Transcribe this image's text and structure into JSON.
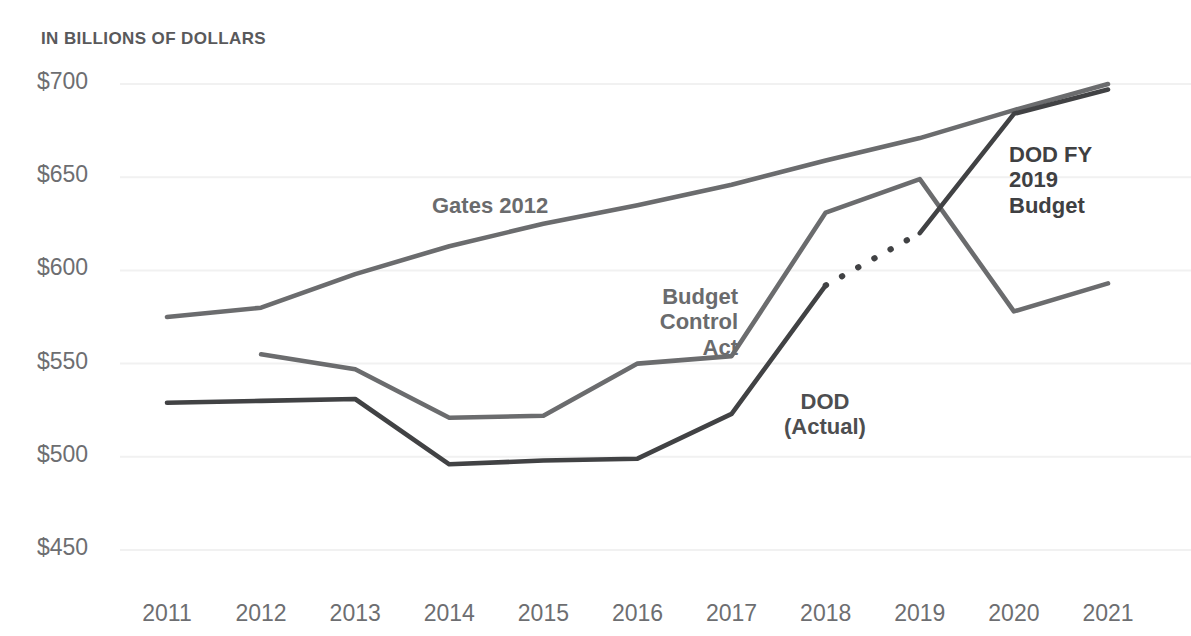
{
  "chart_data": {
    "type": "line",
    "title": "IN BILLIONS OF DOLLARS",
    "xlabel": "",
    "ylabel": "",
    "ylim": [
      450,
      700
    ],
    "xlim": [
      2011,
      2021
    ],
    "grid": true,
    "legend_position": "inline-annotations",
    "categories": [
      2011,
      2012,
      2013,
      2014,
      2015,
      2016,
      2017,
      2018,
      2019,
      2020,
      2021
    ],
    "y_ticks": [
      "$700",
      "$650",
      "$600",
      "$550",
      "$500",
      "$450"
    ],
    "y_tick_values": [
      700,
      650,
      600,
      550,
      500,
      450
    ],
    "x_ticks": [
      "2011",
      "2012",
      "2013",
      "2014",
      "2015",
      "2016",
      "2017",
      "2018",
      "2019",
      "2020",
      "2021"
    ],
    "series": [
      {
        "name": "Gates 2012",
        "color": "#6b6c6e",
        "style": "solid",
        "x": [
          2011,
          2012,
          2013,
          2014,
          2015,
          2016,
          2017,
          2018,
          2019,
          2020,
          2021
        ],
        "values": [
          575,
          580,
          598,
          613,
          625,
          635,
          646,
          659,
          671,
          686,
          700
        ]
      },
      {
        "name": "Budget Control Act",
        "color": "#6b6c6e",
        "style": "solid",
        "x": [
          2012,
          2013,
          2014,
          2015,
          2016,
          2017,
          2018,
          2019,
          2020,
          2021
        ],
        "values": [
          555,
          547,
          521,
          522,
          550,
          554,
          631,
          649,
          578,
          593
        ]
      },
      {
        "name": "DOD (Actual)",
        "color": "#414244",
        "style": "solid",
        "x": [
          2011,
          2012,
          2013,
          2014,
          2015,
          2016,
          2017,
          2018
        ],
        "values": [
          529,
          530,
          531,
          496,
          498,
          499,
          523,
          592
        ]
      },
      {
        "name": "DOD (Actual) projected",
        "color": "#414244",
        "style": "dotted",
        "x": [
          2018,
          2019
        ],
        "values": [
          592,
          620
        ]
      },
      {
        "name": "DOD FY 2019 Budget",
        "color": "#414244",
        "style": "solid",
        "x": [
          2019,
          2020,
          2021
        ],
        "values": [
          620,
          684,
          697
        ]
      }
    ],
    "annotations": [
      {
        "id": "gates",
        "text": "Gates 2012"
      },
      {
        "id": "bca",
        "text": "Budget\nControl\nAct"
      },
      {
        "id": "dod_actual",
        "text": "DOD\n(Actual)"
      },
      {
        "id": "dod_budget",
        "text": "DOD FY\n2019\nBudget"
      }
    ],
    "colors": {
      "grid": "#f1f1f1",
      "tick_text": "#6d6e71",
      "title_text": "#59595b",
      "background": "#ffffff"
    }
  }
}
